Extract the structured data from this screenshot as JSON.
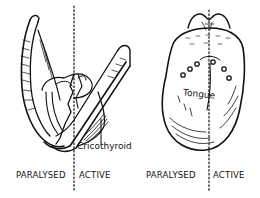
{
  "figure": {
    "panels": [
      {
        "name": "larynx",
        "annotation": "Cricothyroid",
        "side_labels": {
          "left": "PARALYSED",
          "right": "ACTIVE"
        }
      },
      {
        "name": "tongue",
        "annotation": "Tongue",
        "side_labels": {
          "left": "PARALYSED",
          "right": "ACTIVE"
        }
      }
    ],
    "colors": {
      "ink": "#111111",
      "paper": "#ffffff"
    }
  }
}
